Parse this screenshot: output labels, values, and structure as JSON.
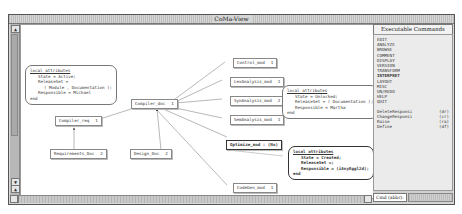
{
  "window": {
    "title": "CoMa-View"
  },
  "graph": {
    "nodes": [
      {
        "id": "compiler_doc",
        "label": "Compiler_doc",
        "count": "1"
      },
      {
        "id": "compiler_req",
        "label": "Compiler_req",
        "count": "1"
      },
      {
        "id": "control_mod",
        "label": "Control_mod",
        "count": "1"
      },
      {
        "id": "lexanalysis_mod",
        "label": "LexAnalysis_mod",
        "count": "1"
      },
      {
        "id": "synanalysis_mod",
        "label": "SynAnalysis_mod",
        "count": "2"
      },
      {
        "id": "semanalysis_mod",
        "label": "SemAnalysis_mod",
        "count": "1"
      },
      {
        "id": "optimize_mod",
        "label": "Optimize_mod",
        "count": ": (No)"
      },
      {
        "id": "codegen_mod",
        "label": "CodeGen_mod",
        "count": "1"
      },
      {
        "id": "requirements_doc",
        "label": "Requirements_Doc",
        "count": "2"
      },
      {
        "id": "design_doc",
        "label": "Design_Doc",
        "count": "2"
      }
    ],
    "attribute_boxes": [
      {
        "header": "local attributes",
        "lines": [
          "State = Active;",
          "ReleaseSet =",
          "( Module , Documentation );",
          "Responsible = Michael"
        ],
        "footer": "end"
      },
      {
        "header": "local attributes",
        "lines": [
          "State = Unlocked;",
          "ReleaseSet = ( Documentation );",
          "Responsible = Martha"
        ],
        "footer": "end"
      },
      {
        "header": "local attributes",
        "lines": [
          "State = Created;",
          "ReleaseSet =;",
          "Responsible = (iAnyEggl2d);"
        ],
        "footer": "end"
      }
    ]
  },
  "commands_panel": {
    "title": "Executable Commands",
    "menu": [
      "EDIT",
      "ANALYZE",
      "BROWSE",
      "COMMENT",
      "DISPLAY",
      "VERSION",
      "TRANSFORM",
      "INTERPRET",
      "LAYOUT",
      "MISC",
      "UN/REDO",
      "HELP",
      "QUIT"
    ],
    "active_item": "INTERPRET",
    "shortcuts": [
      {
        "label": "DeleteResponsi",
        "abbr": "(dr)"
      },
      {
        "label": "ChangeResponsi",
        "abbr": "(cr)"
      },
      {
        "label": "Raise",
        "abbr": "(ra)"
      },
      {
        "label": "Define",
        "abbr": "(df)"
      }
    ],
    "cmd_field_label": "Cmd (abbr):",
    "cmd_field_value": ""
  },
  "scrollbars": {
    "up": "▲",
    "down": "▼"
  }
}
